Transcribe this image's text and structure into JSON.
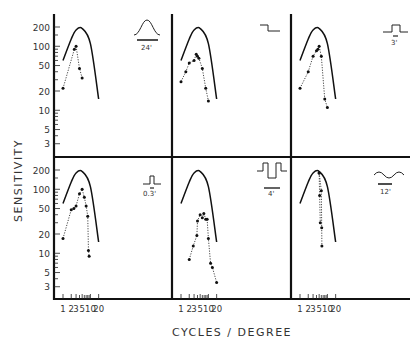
{
  "figure": {
    "ylabel": "SENSITIVITY",
    "xlabel": "CYCLES / DEGREE",
    "y_ticks": [
      "200",
      "100",
      "50",
      "20",
      "10",
      "5",
      "3"
    ],
    "x_ticks": [
      "1",
      "2",
      "3",
      "5",
      "10",
      "20"
    ]
  },
  "chart_data": {
    "type": "line",
    "layout": "2x3 grid of panels, shared log axes",
    "xlabel": "CYCLES / DEGREE",
    "ylabel": "SENSITIVITY",
    "xscale": "log",
    "yscale": "log",
    "xlim": [
      0.7,
      30
    ],
    "ylim": [
      2,
      300
    ],
    "x_tick_labels": [
      "1",
      "2",
      "3",
      "5",
      "10",
      "20"
    ],
    "y_tick_labels": [
      "3",
      "5",
      "10",
      "20",
      "50",
      "100",
      "200"
    ],
    "grid": false,
    "panels": [
      {
        "id": "gaussian-24",
        "stimulus_icon": "gaussian bump",
        "stimulus_label": "24'",
        "reference_curve": {
          "x": [
            1,
            2,
            3,
            5,
            10,
            20
          ],
          "y": [
            60,
            130,
            180,
            190,
            110,
            15
          ]
        },
        "measured": {
          "x": [
            1,
            2.6,
            3,
            4,
            5
          ],
          "y": [
            22,
            90,
            100,
            45,
            32
          ]
        }
      },
      {
        "id": "edge",
        "stimulus_icon": "step edge",
        "stimulus_label": "",
        "reference_curve": {
          "x": [
            1,
            2,
            3,
            5,
            10,
            20
          ],
          "y": [
            60,
            130,
            180,
            190,
            110,
            15
          ]
        },
        "measured": {
          "x": [
            1,
            1.5,
            2,
            3,
            3.6,
            4,
            4.5,
            6,
            8,
            10
          ],
          "y": [
            28,
            40,
            55,
            60,
            75,
            70,
            65,
            45,
            22,
            14
          ]
        }
      },
      {
        "id": "bar-3",
        "stimulus_icon": "narrow positive bar",
        "stimulus_label": "3'",
        "reference_curve": {
          "x": [
            1,
            2,
            3,
            5,
            10,
            20
          ],
          "y": [
            60,
            130,
            180,
            190,
            110,
            15
          ]
        },
        "measured": {
          "x": [
            1,
            2,
            3,
            4,
            4.5,
            5,
            6,
            8,
            10
          ],
          "y": [
            22,
            40,
            70,
            85,
            90,
            100,
            70,
            15,
            11
          ]
        }
      },
      {
        "id": "bar-0.3",
        "stimulus_icon": "thin positive bar",
        "stimulus_label": "0.3'",
        "reference_curve": {
          "x": [
            1,
            2,
            3,
            5,
            10,
            20
          ],
          "y": [
            60,
            130,
            180,
            190,
            110,
            15
          ]
        },
        "measured": {
          "x": [
            1,
            2,
            2.5,
            3,
            4,
            5,
            6,
            7,
            8,
            8.5,
            9
          ],
          "y": [
            17,
            48,
            50,
            55,
            85,
            100,
            75,
            55,
            38,
            11,
            9
          ]
        }
      },
      {
        "id": "double-bar-4",
        "stimulus_icon": "negative double bar",
        "stimulus_label": "4'",
        "reference_curve": {
          "x": [
            1,
            2,
            3,
            5,
            10,
            20
          ],
          "y": [
            60,
            130,
            180,
            190,
            110,
            15
          ]
        },
        "measured": {
          "x": [
            2,
            2.8,
            3.8,
            4,
            5,
            6,
            6.8,
            8,
            9,
            10,
            12,
            14,
            20
          ],
          "y": [
            8,
            13,
            19,
            32,
            40,
            36,
            42,
            34,
            34,
            17,
            7,
            6,
            3.5
          ]
        }
      },
      {
        "id": "sine-12",
        "stimulus_icon": "sine wave",
        "stimulus_label": "12'",
        "reference_curve": {
          "x": [
            1,
            2,
            3,
            5,
            10,
            20
          ],
          "y": [
            60,
            130,
            180,
            190,
            110,
            15
          ]
        },
        "measured_series": [
          {
            "x": [
              5,
              5.2,
              5.5
            ],
            "y": [
              180,
              80,
              30
            ]
          },
          {
            "x": [
              5,
              6,
              6.2,
              6.3
            ],
            "y": [
              180,
              95,
              25,
              13
            ]
          }
        ]
      }
    ]
  },
  "panels": [
    {
      "stim_label": "24'"
    },
    {
      "stim_label": ""
    },
    {
      "stim_label": "3'"
    },
    {
      "stim_label": "0.3'"
    },
    {
      "stim_label": "4'"
    },
    {
      "stim_label": "12'"
    }
  ]
}
